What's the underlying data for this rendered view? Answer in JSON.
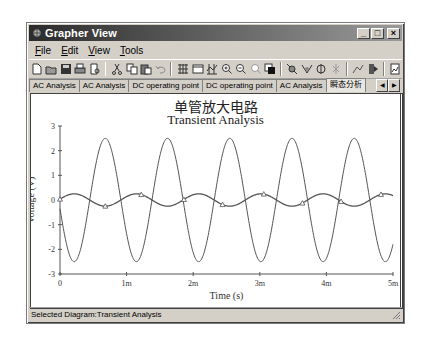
{
  "window": {
    "title": "Grapher View",
    "controls": [
      "minimize",
      "maximize",
      "close"
    ]
  },
  "menu": {
    "items": [
      "File",
      "Edit",
      "View",
      "Tools"
    ]
  },
  "toolbar": {
    "groups": [
      [
        "new-icon",
        "open-icon",
        "save-icon",
        "print-icon",
        "print-preview-icon"
      ],
      [
        "cut-icon",
        "copy-icon",
        "paste-icon",
        "undo-icon"
      ],
      [
        "grid-icon",
        "legend-icon",
        "toggle-cursors-icon",
        "zoom-in-icon",
        "zoom-out-icon",
        "zoom-full-icon",
        "reverse-colors-icon"
      ],
      [
        "add-traces-icon",
        "add-trace-icon",
        "overlay-icon",
        "select-marks-icon"
      ],
      [
        "show-markers-icon",
        "export-excel-icon"
      ],
      [
        "export-mathcad-icon"
      ]
    ]
  },
  "tabs": {
    "items": [
      "AC Analysis",
      "AC Analysis",
      "DC operating point",
      "DC operating point",
      "AC Analysis",
      "瞬态分析"
    ],
    "active_index": 5,
    "nav": [
      "scroll-left",
      "scroll-right"
    ]
  },
  "chart": {
    "title_cn": "单管放大电路",
    "title": "Transient Analysis"
  },
  "status": {
    "text": "Selected Diagram:Transient Analysis"
  },
  "chart_data": {
    "type": "line",
    "xlabel": "Time (s)",
    "ylabel": "Voltage (V)",
    "xlim": [
      0,
      0.005
    ],
    "ylim": [
      -3,
      3
    ],
    "x_ticks": [
      "0",
      "1m",
      "2m",
      "3m",
      "4m",
      "5m"
    ],
    "y_ticks": [
      "3",
      "2",
      "1",
      "0",
      "-1",
      "-2",
      "-3"
    ],
    "grid": false,
    "legend": null,
    "series": [
      {
        "name": "output",
        "description": "large sine, inverted output",
        "amplitude": 2.5,
        "frequency_hz": 1070,
        "peaks_at_ms": [
          0.68,
          1.62,
          2.55,
          3.48,
          4.42
        ],
        "troughs_at_ms": [
          0.22,
          1.15,
          2.08,
          3.02,
          3.95,
          4.88
        ],
        "color": "#555555"
      },
      {
        "name": "input",
        "description": "small sine with triangle markers",
        "amplitude": 0.25,
        "frequency_hz": 1070,
        "marker": "triangle",
        "marker_points": [
          {
            "t_ms": 0.0,
            "v": 0.0
          },
          {
            "t_ms": 0.68,
            "v": -0.25
          },
          {
            "t_ms": 1.22,
            "v": 0.22
          },
          {
            "t_ms": 1.86,
            "v": -0.2
          },
          {
            "t_ms": 2.44,
            "v": 0.15
          },
          {
            "t_ms": 3.06,
            "v": -0.08
          },
          {
            "t_ms": 3.64,
            "v": -0.15
          },
          {
            "t_ms": 4.22,
            "v": 0.24
          },
          {
            "t_ms": 4.82,
            "v": -0.25
          }
        ],
        "color": "#555555"
      }
    ]
  }
}
